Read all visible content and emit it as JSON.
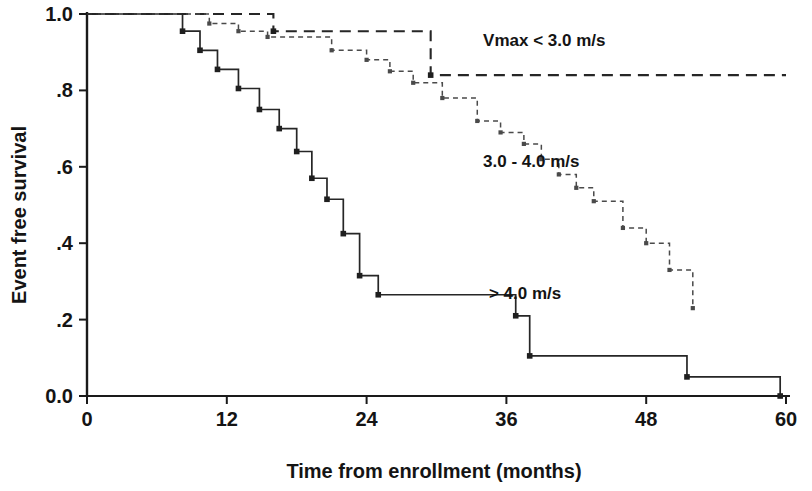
{
  "chart_data": {
    "type": "line",
    "title": "",
    "xlabel": "Time from enrollment (months)",
    "ylabel": "Event free survival",
    "xlim": [
      0,
      60
    ],
    "ylim": [
      0.0,
      1.0
    ],
    "xticks": [
      0,
      12,
      24,
      36,
      48,
      60
    ],
    "xticklabels": [
      "0",
      "12",
      "24",
      "36",
      "48",
      "60"
    ],
    "yticks": [
      0.0,
      0.2,
      0.4,
      0.6,
      0.8,
      1.0
    ],
    "yticklabels": [
      "0.0",
      ".2",
      ".4",
      ".6",
      ".8",
      "1.0"
    ],
    "grid": false,
    "legend_position": "inline-annotations",
    "curve_style": "kaplan-meier-step",
    "series": [
      {
        "name": "Vmax < 3.0 m/s",
        "label": "Vmax < 3.0 m/s",
        "linestyle": "long-dashed",
        "annotation_x": 34.0,
        "annotation_y": 0.915,
        "x": [
          0,
          16.0,
          16.0,
          29.5,
          29.5,
          60.0
        ],
        "y": [
          1.0,
          1.0,
          0.955,
          0.955,
          0.84,
          0.84
        ],
        "censor_x": [
          16.0,
          29.5
        ],
        "censor_y": [
          0.955,
          0.84
        ]
      },
      {
        "name": "3.0 - 4.0 m/s",
        "label": "3.0 - 4.0 m/s",
        "linestyle": "fine-dashed",
        "annotation_x": 34.0,
        "annotation_y": 0.6,
        "x": [
          0,
          10.5,
          10.5,
          13.0,
          13.0,
          15.5,
          15.5,
          21.0,
          21.0,
          24.0,
          24.0,
          26.0,
          26.0,
          28.0,
          28.0,
          30.5,
          30.5,
          33.5,
          33.5,
          35.5,
          35.5,
          37.5,
          37.5,
          39.0,
          39.0,
          40.5,
          40.5,
          42.0,
          42.0,
          43.5,
          43.5,
          46.0,
          46.0,
          48.0,
          48.0,
          50.0,
          50.0,
          52.0,
          52.0
        ],
        "y": [
          1.0,
          1.0,
          0.975,
          0.975,
          0.955,
          0.955,
          0.94,
          0.94,
          0.905,
          0.905,
          0.88,
          0.88,
          0.85,
          0.85,
          0.82,
          0.82,
          0.78,
          0.78,
          0.72,
          0.72,
          0.69,
          0.69,
          0.66,
          0.66,
          0.62,
          0.62,
          0.58,
          0.58,
          0.545,
          0.545,
          0.51,
          0.51,
          0.44,
          0.44,
          0.4,
          0.4,
          0.33,
          0.33,
          0.23
        ],
        "censor_x": [
          10.5,
          13.0,
          15.5,
          21.0,
          24.0,
          26.0,
          28.0,
          30.5,
          33.5,
          35.5,
          37.5,
          39.0,
          40.5,
          42.0,
          43.5,
          46.0,
          48.0,
          50.0,
          52.0
        ],
        "censor_y": [
          0.975,
          0.955,
          0.94,
          0.905,
          0.88,
          0.85,
          0.82,
          0.78,
          0.72,
          0.69,
          0.66,
          0.62,
          0.58,
          0.545,
          0.51,
          0.44,
          0.4,
          0.33,
          0.23
        ]
      },
      {
        "name": "> 4.0 m/s",
        "label": "> 4.0 m/s",
        "linestyle": "solid",
        "annotation_x": 34.5,
        "annotation_y": 0.255,
        "x": [
          0,
          8.2,
          8.2,
          9.7,
          9.7,
          11.2,
          11.2,
          13.0,
          13.0,
          14.8,
          14.8,
          16.5,
          16.5,
          18.0,
          18.0,
          19.3,
          19.3,
          20.6,
          20.6,
          22.0,
          22.0,
          23.4,
          23.4,
          25.0,
          25.0,
          36.8,
          36.8,
          38.0,
          38.0,
          51.5,
          51.5,
          59.5,
          59.5
        ],
        "y": [
          1.0,
          1.0,
          0.955,
          0.955,
          0.905,
          0.905,
          0.855,
          0.855,
          0.805,
          0.805,
          0.75,
          0.75,
          0.7,
          0.7,
          0.64,
          0.64,
          0.57,
          0.57,
          0.515,
          0.515,
          0.425,
          0.425,
          0.315,
          0.315,
          0.265,
          0.265,
          0.21,
          0.21,
          0.105,
          0.105,
          0.05,
          0.05,
          0.0
        ],
        "censor_x": [
          8.2,
          9.7,
          11.2,
          13.0,
          14.8,
          16.5,
          18.0,
          19.3,
          20.6,
          22.0,
          23.4,
          25.0,
          36.8,
          38.0,
          51.5,
          59.5
        ],
        "censor_y": [
          0.955,
          0.905,
          0.855,
          0.805,
          0.75,
          0.7,
          0.64,
          0.57,
          0.515,
          0.425,
          0.315,
          0.265,
          0.21,
          0.105,
          0.05,
          0.0
        ]
      }
    ]
  },
  "colors": {
    "axis": "#1a1a1a",
    "solid_series": "#262626",
    "longdash_series": "#262626",
    "finedash_series": "#4a4a4a",
    "background": "#ffffff",
    "text": "#141414"
  }
}
